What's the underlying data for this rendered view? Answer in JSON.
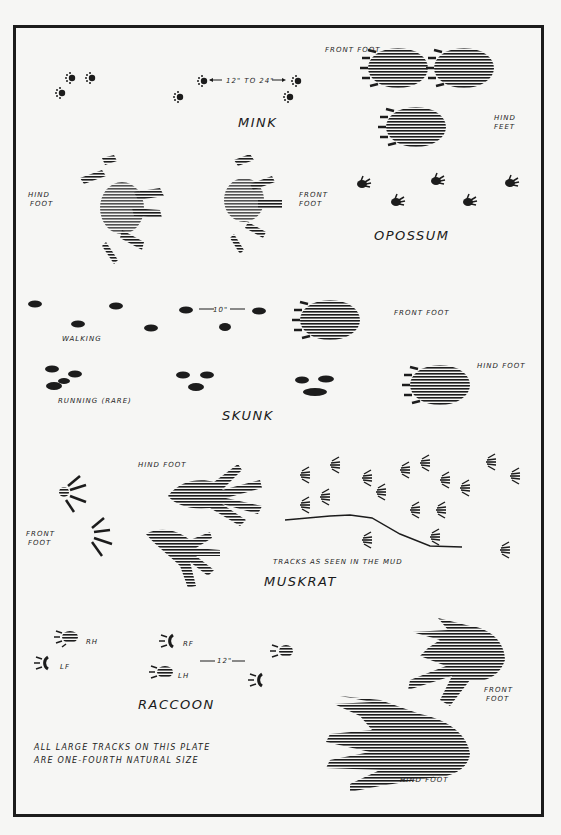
{
  "plate": {
    "title": "Animal tracks plate",
    "footnote_line1": "All large tracks on this plate",
    "footnote_line2": "are one-fourth natural size"
  },
  "sections": {
    "mink": {
      "name": "MINK",
      "distance": "12\" to 24\"",
      "front_foot_label": "Front foot",
      "hind_feet_label_1": "Hind",
      "hind_feet_label_2": "feet"
    },
    "opossum": {
      "name": "OPOSSUM",
      "hind_foot_label_1": "Hind",
      "hind_foot_label_2": "foot",
      "front_foot_label_1": "Front",
      "front_foot_label_2": "foot"
    },
    "skunk": {
      "name": "SKUNK",
      "distance": "10\"",
      "walking_label": "Walking",
      "running_label": "Running (rare)",
      "front_foot_label": "Front foot",
      "hind_foot_label": "Hind foot"
    },
    "muskrat": {
      "name": "MUSKRAT",
      "hind_foot_label": "Hind foot",
      "front_foot_label_1": "Front",
      "front_foot_label_2": "foot",
      "mud_label": "Tracks as seen in the mud"
    },
    "raccoon": {
      "name": "RACCOON",
      "distance": "12\"",
      "rh": "RH",
      "rf": "RF",
      "lf": "LF",
      "lh": "LH",
      "front_foot_label_1": "Front",
      "front_foot_label_2": "foot",
      "hind_foot_label": "Hind foot"
    }
  },
  "colors": {
    "ink": "#1c1c1c",
    "paper": "#f6f6f4"
  }
}
